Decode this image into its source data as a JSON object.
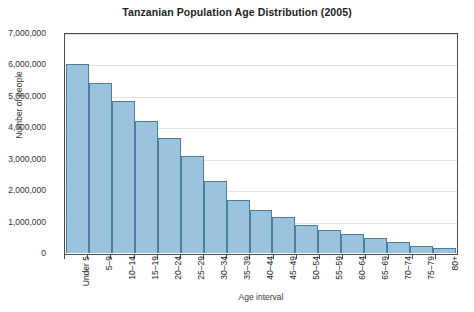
{
  "chart_data": {
    "type": "bar",
    "title": "Tanzanian Population Age Distribution (2005)",
    "xlabel": "Age interval",
    "ylabel": "Number of people",
    "categories": [
      "Under 5",
      "5–9",
      "10–14",
      "15–19",
      "20–24",
      "25–29",
      "30–34",
      "35–39",
      "40–44",
      "45–49",
      "50–54",
      "55–59",
      "60–64",
      "65–69",
      "70–74",
      "75–79",
      "80+"
    ],
    "values": [
      6000000,
      5400000,
      4850000,
      4200000,
      3650000,
      3080000,
      2300000,
      1700000,
      1360000,
      1140000,
      900000,
      730000,
      600000,
      480000,
      350000,
      230000,
      150000
    ],
    "ylim": [
      0,
      7000000
    ],
    "ytick_values": [
      0,
      1000000,
      2000000,
      3000000,
      4000000,
      5000000,
      6000000,
      7000000
    ],
    "ytick_labels": [
      "0",
      "1,000,000",
      "2,000,000",
      "3,000,000",
      "4,000,000",
      "5,000,000",
      "6,000,000",
      "7,000,000"
    ],
    "grid": "horizontal",
    "legend": "none",
    "bar_fill_color": "#9cc3dd",
    "bar_edge_color": "#4a7f9e",
    "gridline_color": "#e2e2e2",
    "axis_color": "#4a4a4a"
  }
}
